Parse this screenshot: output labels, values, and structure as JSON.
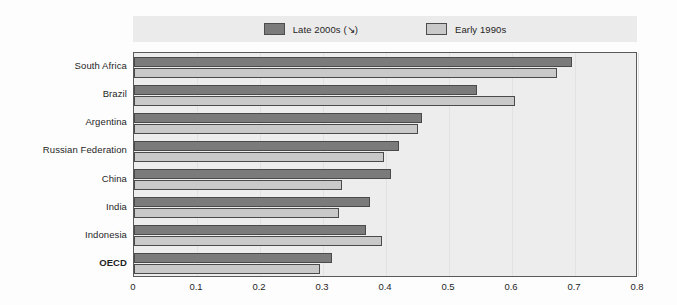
{
  "chart_data": {
    "type": "bar",
    "orientation": "horizontal",
    "title": "",
    "xlabel": "",
    "ylabel": "",
    "xlim": [
      0,
      0.8
    ],
    "xticks": [
      "0",
      "0.1",
      "0.2",
      "0.3",
      "0.4",
      "0.5",
      "0.6",
      "0.7",
      "0.8"
    ],
    "xtick_values": [
      0,
      0.1,
      0.2,
      0.3,
      0.4,
      0.5,
      0.6,
      0.7,
      0.8
    ],
    "grid": true,
    "legend_position": "top",
    "categories": [
      "South Africa",
      "Brazil",
      "Argentina",
      "Russian Federation",
      "China",
      "India",
      "Indonesia",
      "OECD"
    ],
    "emphasized_categories": [
      "OECD"
    ],
    "series": [
      {
        "name": "Late 2000s (↘)",
        "color": "#7b7b7b",
        "values": [
          0.695,
          0.545,
          0.457,
          0.421,
          0.408,
          0.375,
          0.368,
          0.314
        ]
      },
      {
        "name": "Early 1990s",
        "color": "#c9c9c9",
        "values": [
          0.672,
          0.605,
          0.451,
          0.397,
          0.33,
          0.325,
          0.393,
          0.295
        ]
      }
    ]
  },
  "legend": {
    "items": [
      {
        "label": "Late 2000s (↘)",
        "swatch": "dark"
      },
      {
        "label": "Early 1990s",
        "swatch": "light"
      }
    ]
  },
  "colors": {
    "series_late_2000s": "#7b7b7b",
    "series_early_1990s": "#c9c9c9",
    "plot_background": "#ededed",
    "legend_background": "#ebebeb",
    "axis_line": "#5a5a5a"
  }
}
